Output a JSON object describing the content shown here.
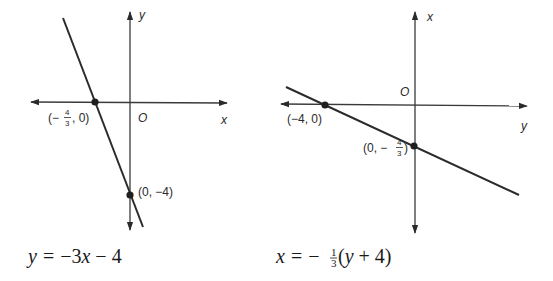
{
  "figures": [
    {
      "id": "left",
      "equation": {
        "lhs": "y",
        "equals": "=",
        "rhs": "−3x − 4",
        "text": "y = −3x − 4"
      },
      "axes": {
        "horizontal_label": "x",
        "vertical_label": "y",
        "origin_label": "O"
      },
      "points": [
        {
          "label": "(−4/3, 0)",
          "open": "(−",
          "num": "4",
          "den": "3",
          "close": ", 0)",
          "x": -1.3333,
          "y": 0
        },
        {
          "label": "(0, −4)",
          "x": 0,
          "y": -4
        }
      ],
      "line": {
        "slope": -3,
        "intercept": -4
      }
    },
    {
      "id": "right",
      "equation": {
        "lhs": "x",
        "equals": "=",
        "minus": "−",
        "frac_num": "1",
        "frac_den": "3",
        "paren_open": "(",
        "inner": "y",
        "plus": "+ 4)",
        "text": "x = −1/3(y + 4)"
      },
      "axes": {
        "horizontal_label": "y",
        "vertical_label": "x",
        "origin_label": "O"
      },
      "points": [
        {
          "label": "(−4, 0)",
          "y": -4,
          "x": 0
        },
        {
          "label": "(0, −4/3)",
          "open": "(0, −",
          "num": "4",
          "den": "3",
          "close": ")",
          "y": 0,
          "x": -1.3333
        }
      ],
      "line": {
        "slope": -0.3333,
        "intercept": -1.3333
      }
    }
  ],
  "colors": {
    "line": "#2b2b2b",
    "axis": "#3a3a3a",
    "text": "#1a1a1a",
    "background": "#ffffff"
  }
}
